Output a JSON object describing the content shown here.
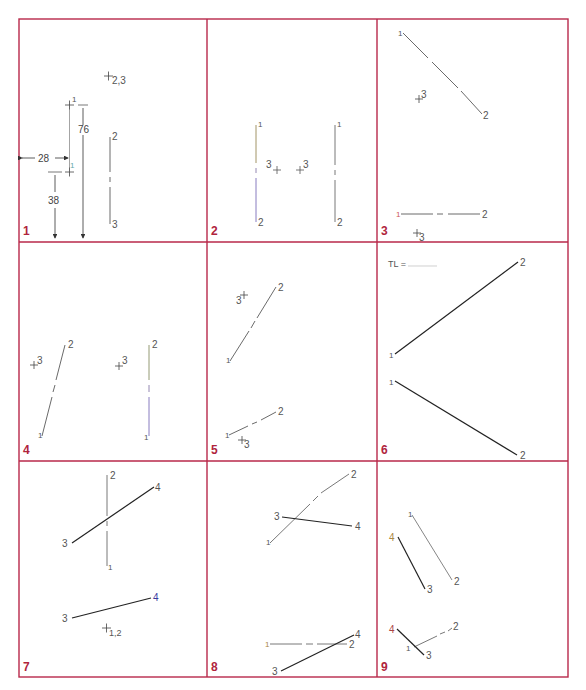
{
  "colors": {
    "frame": "#b8294a",
    "line_thin": "#555555",
    "line_bold": "#222222",
    "label": "#555555",
    "cell_number": "#b0243c"
  },
  "cells": [
    {
      "number": "1"
    },
    {
      "number": "2"
    },
    {
      "number": "3"
    },
    {
      "number": "4"
    },
    {
      "number": "5"
    },
    {
      "number": "6"
    },
    {
      "number": "7"
    },
    {
      "number": "8"
    },
    {
      "number": "9"
    }
  ],
  "cell1": {
    "point_label_23": "2,3",
    "point_label_1a": "1",
    "point_label_1b": "1",
    "line_label_top": "2",
    "line_label_bottom": "3",
    "dim_horizontal": "28",
    "dim_vertical_top": "76",
    "dim_vertical_low": "38"
  },
  "cell2": {
    "left_line_top": "1",
    "left_line_bottom": "2",
    "right_line_top": "1",
    "right_line_bottom": "2",
    "point_left": "3",
    "point_right": "3"
  },
  "cell3": {
    "top_p1": "1",
    "top_p2": "2",
    "top_p3": "3",
    "bot_p1": "1",
    "bot_p2": "2",
    "bot_p3": "3"
  },
  "cell4": {
    "left_p1": "1",
    "left_p2": "2",
    "left_p3": "3",
    "right_p1": "1",
    "right_p2": "2",
    "right_p3": "3"
  },
  "cell5": {
    "top_p1": "1",
    "top_p2": "2",
    "top_p3": "3",
    "bot_p1": "1",
    "bot_p2": "2",
    "bot_p3": "3"
  },
  "cell6": {
    "tl_label": "TL =",
    "top_p1": "1",
    "top_p2": "2",
    "bot_p1": "1",
    "bot_p2": "2"
  },
  "cell7": {
    "top_p1": "1",
    "top_p2": "2",
    "top_p3": "3",
    "top_p4": "4",
    "bot_p3": "3",
    "bot_p4": "4",
    "bot_p12": "1,2"
  },
  "cell8": {
    "top_p1": "1",
    "top_p2": "2",
    "top_p3": "3",
    "top_p4": "4",
    "bot_p1": "1",
    "bot_p2": "2",
    "bot_p3": "3",
    "bot_p4": "4"
  },
  "cell9": {
    "top_p1": "1",
    "top_p2": "2",
    "top_p3": "3",
    "top_p4": "4",
    "bot_p1": "1",
    "bot_p2": "2",
    "bot_p3": "3",
    "bot_p4": "4"
  }
}
